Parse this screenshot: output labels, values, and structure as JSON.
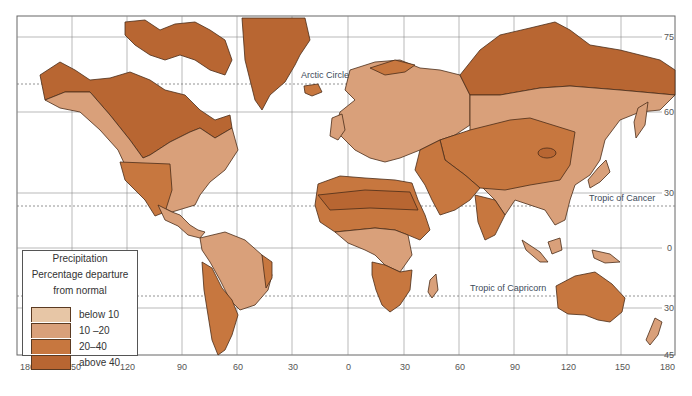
{
  "map": {
    "title": "Precipitation Percentage departure from normal",
    "legend": {
      "title_lines": [
        "Precipitation",
        "Percentage departure",
        "from normal"
      ],
      "items": [
        {
          "label": "below 10",
          "color": "#e7c6a6"
        },
        {
          "label": "10 –20",
          "color": "#d9a07a"
        },
        {
          "label": "20–40",
          "color": "#c7773f"
        },
        {
          "label": "above 40",
          "color": "#b86632"
        }
      ]
    },
    "longitude_ticks": [
      "180",
      "150",
      "120",
      "90",
      "60",
      "30",
      "0",
      "30",
      "60",
      "90",
      "120",
      "150",
      "180"
    ],
    "latitude_ticks": [
      "75",
      "60",
      "30",
      "0",
      "30",
      "45"
    ],
    "reference_lines": [
      {
        "name": "arctic-circle",
        "label": "Arctic Circle"
      },
      {
        "name": "tropic-of-cancer",
        "label": "Tropic of Cancer"
      },
      {
        "name": "tropic-of-capricorn",
        "label": "Tropic of Capricorn"
      }
    ],
    "colors": {
      "low": "#e7c6a6",
      "mid": "#d9a07a",
      "high": "#c7773f",
      "very_high": "#b86632",
      "outline": "#4a2c18",
      "grid": "#888888"
    }
  }
}
